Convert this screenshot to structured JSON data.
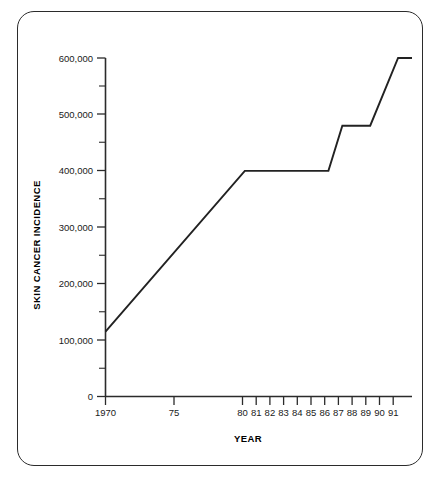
{
  "chart_data": {
    "type": "line",
    "title": "",
    "xlabel": "YEAR",
    "ylabel": "SKIN CANCER INCIDENCE",
    "xlim": [
      1970,
      1992
    ],
    "ylim": [
      0,
      600000
    ],
    "grid": false,
    "legend": null,
    "y_ticks_major": [
      0,
      100000,
      200000,
      300000,
      400000,
      500000,
      600000
    ],
    "y_tick_labels": [
      "0",
      "100,000",
      "200,000",
      "300,000",
      "400,000",
      "500,000",
      "600,000"
    ],
    "y_ticks_minor": [
      50000,
      150000,
      250000,
      350000,
      450000,
      550000
    ],
    "x_ticks": [
      1970,
      1975,
      1980,
      1981,
      1982,
      1983,
      1984,
      1985,
      1986,
      1987,
      1988,
      1989,
      1990,
      1991
    ],
    "x_tick_labels": [
      "1970",
      "75",
      "80",
      "81",
      "82",
      "83",
      "84",
      "85",
      "86",
      "87",
      "88",
      "89",
      "90",
      "91"
    ],
    "x": [
      1970,
      1980,
      1986,
      1987,
      1989,
      1991,
      1992
    ],
    "values": [
      115000,
      400000,
      400000,
      480000,
      480000,
      600000,
      600000
    ],
    "series": [
      {
        "name": "Skin cancer incidence",
        "points": [
          {
            "year": 1970,
            "value": 115000
          },
          {
            "year": 1980,
            "value": 400000
          },
          {
            "year": 1986,
            "value": 400000
          },
          {
            "year": 1987,
            "value": 480000
          },
          {
            "year": 1989,
            "value": 480000
          },
          {
            "year": 1991,
            "value": 600000
          },
          {
            "year": 1992,
            "value": 600000
          }
        ],
        "color": "#222222"
      }
    ]
  },
  "axes": {
    "x_axis_title": "YEAR",
    "y_axis_title": "SKIN CANCER INCIDENCE"
  },
  "y_labels": {
    "t0": "0",
    "t1": "100,000",
    "t2": "200,000",
    "t3": "300,000",
    "t4": "400,000",
    "t5": "500,000",
    "t6": "600,000"
  },
  "x_labels": {
    "t0": "1970",
    "t1": "75",
    "t2": "80",
    "t3": "81",
    "t4": "82",
    "t5": "83",
    "t6": "84",
    "t7": "85",
    "t8": "86",
    "t9": "87",
    "t10": "88",
    "t11": "89",
    "t12": "90",
    "t13": "91"
  },
  "colors": {
    "line": "#222222",
    "axis": "#2b2b2b",
    "frame": "#2b2b2b",
    "text": "#1a1a1a",
    "background": "#ffffff"
  }
}
